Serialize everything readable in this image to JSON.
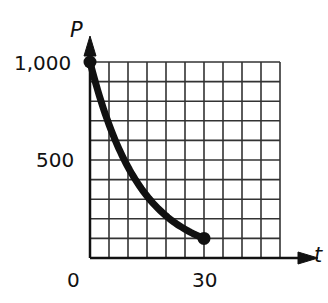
{
  "chart_data": {
    "type": "line",
    "title": "",
    "xlabel": "t",
    "ylabel": "P",
    "xlim": [
      0,
      50
    ],
    "ylim": [
      0,
      1000
    ],
    "grid": true,
    "grid_x_step": 5,
    "grid_y_step": 100,
    "x_tick_labels": [
      "0",
      "30"
    ],
    "y_tick_labels": [
      "500",
      "1,000"
    ],
    "series": [
      {
        "name": "P(t)",
        "x": [
          0,
          5,
          10,
          15,
          20,
          25,
          30
        ],
        "values": [
          1000,
          680,
          460,
          310,
          210,
          140,
          100
        ]
      }
    ],
    "endpoints": [
      [
        0,
        1000
      ],
      [
        30,
        100
      ]
    ],
    "color": "#111111"
  },
  "labels": {
    "y_axis": "P",
    "x_axis": "t",
    "y_top": "1,000",
    "y_mid": "500",
    "x_origin": "0",
    "x_30": "30"
  }
}
